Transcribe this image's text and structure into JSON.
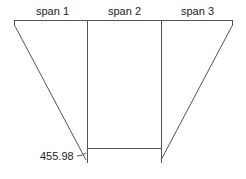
{
  "diagram": {
    "spans": [
      {
        "label": "span 1"
      },
      {
        "label": "span 2"
      },
      {
        "label": "span 3"
      }
    ],
    "annotation": {
      "value": "455.98"
    },
    "colors": {
      "line": "#555555",
      "text": "#222222"
    }
  }
}
